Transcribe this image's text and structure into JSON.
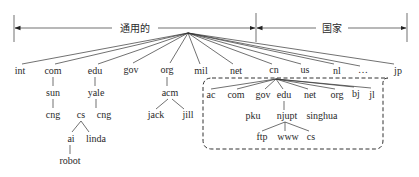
{
  "header": {
    "generic_label": "通用的",
    "country_label": "国家"
  },
  "tree": {
    "root": "",
    "top_level": [
      "int",
      "com",
      "edu",
      "gov",
      "org",
      "mil",
      "net",
      "cn",
      "us",
      "nl",
      "…",
      "jp"
    ],
    "com": {
      "children": [
        "sun"
      ],
      "sun": {
        "children": [
          "cng"
        ]
      }
    },
    "edu": {
      "children": [
        "yale"
      ],
      "yale": {
        "children": [
          "cs",
          "cng"
        ],
        "cs": {
          "children": [
            "ai",
            "linda"
          ],
          "ai": {
            "children": [
              "robot"
            ]
          }
        }
      }
    },
    "org": {
      "children": [
        "acm"
      ],
      "acm": {
        "children": [
          "jack",
          "jill"
        ]
      }
    },
    "cn": {
      "children": [
        "ac",
        "com",
        "gov",
        "edu",
        "net",
        "org",
        "bj",
        "jl"
      ],
      "edu": {
        "children": [
          "pku",
          "njupt",
          "singhua"
        ],
        "njupt": {
          "children": [
            "ftp",
            "www",
            "cs"
          ]
        }
      }
    }
  },
  "labels": {
    "int": "int",
    "com": "com",
    "edu": "edu",
    "gov": "gov",
    "org": "org",
    "mil": "mil",
    "net": "net",
    "cn": "cn",
    "us": "us",
    "nl": "nl",
    "ellipsis": "…",
    "jp": "jp",
    "sun": "sun",
    "sun_cng": "cng",
    "yale": "yale",
    "yale_cs": "cs",
    "yale_cng": "cng",
    "ai": "ai",
    "linda": "linda",
    "robot": "robot",
    "acm": "acm",
    "jack": "jack",
    "jill": "jill",
    "cn_ac": "ac",
    "cn_com": "com",
    "cn_gov": "gov",
    "cn_edu": "edu",
    "cn_net": "net",
    "cn_org": "org",
    "cn_bj": "bj",
    "cn_jl": "jl",
    "pku": "pku",
    "njupt": "njupt",
    "singhua": "singhua",
    "ftp": "ftp",
    "www": "www",
    "njupt_cs": "cs"
  }
}
